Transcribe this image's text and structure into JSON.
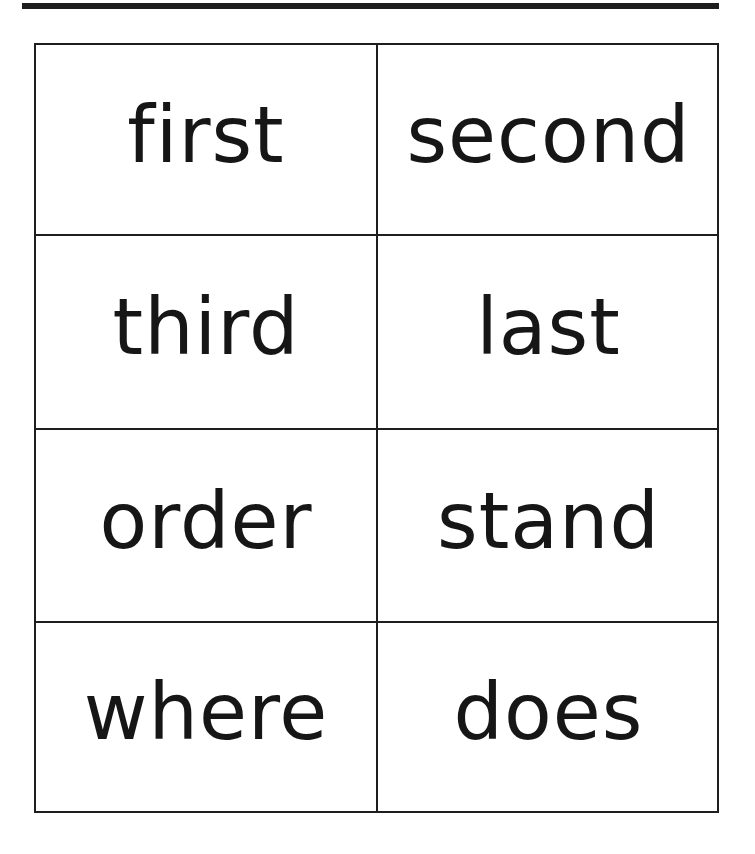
{
  "worksheet": {
    "cards": [
      {
        "word": "first"
      },
      {
        "word": "second"
      },
      {
        "word": "third"
      },
      {
        "word": "last"
      },
      {
        "word": "order"
      },
      {
        "word": "stand"
      },
      {
        "word": "where"
      },
      {
        "word": "does"
      }
    ]
  }
}
